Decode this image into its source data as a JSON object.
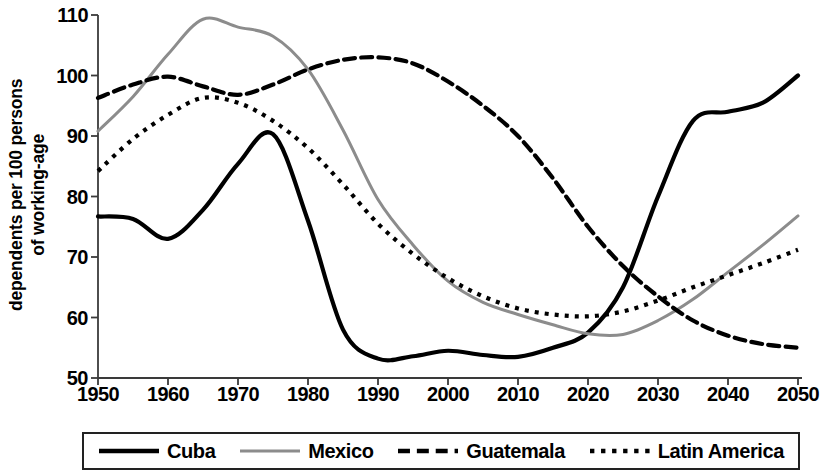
{
  "chart_data": {
    "type": "line",
    "title": "",
    "xlabel": "",
    "ylabel_line1": "dependents per 100 persons",
    "ylabel_line2": "of working-age",
    "xlim": [
      1950,
      2050
    ],
    "ylim": [
      50,
      110
    ],
    "xticks": [
      1950,
      1960,
      1970,
      1980,
      1990,
      2000,
      2010,
      2020,
      2030,
      2040,
      2050
    ],
    "yticks": [
      50,
      60,
      70,
      80,
      90,
      100,
      110
    ],
    "grid": false,
    "legend_position": "bottom",
    "x": [
      1950,
      1955,
      1960,
      1965,
      1970,
      1975,
      1980,
      1985,
      1990,
      1995,
      2000,
      2005,
      2010,
      2015,
      2020,
      2025,
      2030,
      2035,
      2040,
      2045,
      2050
    ],
    "series": [
      {
        "name": "Cuba",
        "color": "#000000",
        "style": "solid",
        "values": [
          76.7,
          76.3,
          73.0,
          77.8,
          85.4,
          90.3,
          76.0,
          58.0,
          53.2,
          53.6,
          54.5,
          53.8,
          53.5,
          55.0,
          57.5,
          65.0,
          80.0,
          92.5,
          94.0,
          95.5,
          100.0
        ]
      },
      {
        "name": "Mexico",
        "color": "#8c8c8c",
        "style": "solid",
        "values": [
          90.8,
          96.5,
          103.5,
          109.3,
          108.0,
          106.5,
          101.0,
          91.0,
          79.5,
          72.0,
          66.0,
          62.5,
          60.5,
          58.8,
          57.3,
          57.2,
          59.5,
          63.0,
          67.5,
          72.0,
          76.8
        ]
      },
      {
        "name": "Guatemala",
        "color": "#000000",
        "style": "dashed",
        "values": [
          96.3,
          98.5,
          99.8,
          98.2,
          96.8,
          98.5,
          101.0,
          102.6,
          103.0,
          102.0,
          99.0,
          95.0,
          90.0,
          83.0,
          75.0,
          68.5,
          63.5,
          59.5,
          57.0,
          55.6,
          55.0
        ]
      },
      {
        "name": "Latin America",
        "color": "#000000",
        "style": "dotted",
        "values": [
          84.2,
          89.5,
          93.5,
          96.3,
          95.5,
          92.5,
          88.0,
          82.0,
          75.5,
          70.5,
          66.5,
          63.5,
          61.5,
          60.5,
          60.2,
          61.0,
          62.8,
          65.0,
          67.0,
          69.0,
          71.2
        ]
      }
    ]
  },
  "axis": {
    "ytick_labels": [
      "110",
      "100",
      "90",
      "80",
      "70",
      "60",
      "50"
    ],
    "xtick_labels": [
      "1950",
      "1960",
      "1970",
      "1980",
      "1990",
      "2000",
      "2010",
      "2020",
      "2030",
      "2040",
      "2050"
    ]
  },
  "legend": {
    "items": [
      {
        "label": "Cuba",
        "style": "solid",
        "color": "#000000"
      },
      {
        "label": "Mexico",
        "style": "solid",
        "color": "#8c8c8c"
      },
      {
        "label": "Guatemala",
        "style": "dashed",
        "color": "#000000"
      },
      {
        "label": "Latin America",
        "style": "dotted",
        "color": "#000000"
      }
    ]
  }
}
